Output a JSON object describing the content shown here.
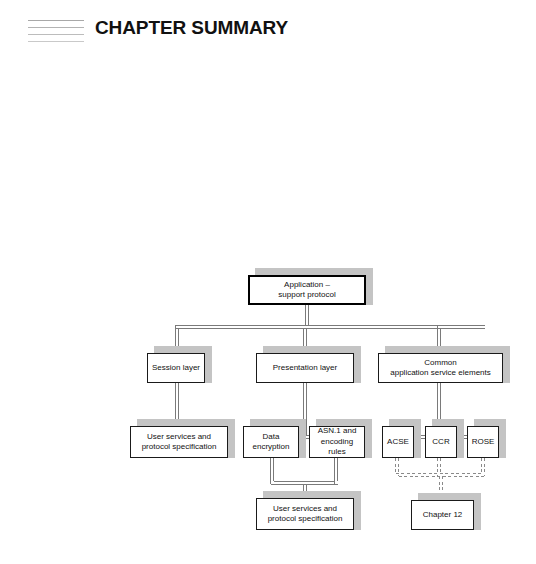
{
  "header": {
    "title": "CHAPTER SUMMARY",
    "menu_icon": "four-horizontal-lines-icon",
    "line_count": 4
  },
  "diagram": {
    "type": "hierarchy-tree",
    "nodes": [
      {
        "id": "root",
        "label": "Application –\nsupport protocol",
        "x": 248,
        "y": 275,
        "w": 118,
        "h": 30,
        "emphasis": "thick-border"
      },
      {
        "id": "session",
        "label": "Session layer",
        "x": 147,
        "y": 353,
        "w": 58,
        "h": 30,
        "emphasis": "normal"
      },
      {
        "id": "presentation",
        "label": "Presentation layer",
        "x": 256,
        "y": 353,
        "w": 98,
        "h": 30,
        "emphasis": "normal"
      },
      {
        "id": "common",
        "label": "Common\napplication service elements",
        "x": 378,
        "y": 353,
        "w": 125,
        "h": 30,
        "emphasis": "normal"
      },
      {
        "id": "user1",
        "label": "User services and\nprotocol specification",
        "x": 130,
        "y": 426,
        "w": 98,
        "h": 32,
        "emphasis": "normal"
      },
      {
        "id": "dataenc",
        "label": "Data\nencryption",
        "x": 243,
        "y": 426,
        "w": 56,
        "h": 32,
        "emphasis": "normal"
      },
      {
        "id": "asn1",
        "label": "ASN.1 and\nencoding rules",
        "x": 309,
        "y": 426,
        "w": 56,
        "h": 32,
        "emphasis": "normal"
      },
      {
        "id": "acse",
        "label": "ACSE",
        "x": 382,
        "y": 426,
        "w": 32,
        "h": 32,
        "emphasis": "normal"
      },
      {
        "id": "ccr",
        "label": "CCR",
        "x": 425,
        "y": 426,
        "w": 32,
        "h": 32,
        "emphasis": "normal"
      },
      {
        "id": "rose",
        "label": "ROSE",
        "x": 467,
        "y": 426,
        "w": 32,
        "h": 32,
        "emphasis": "normal"
      },
      {
        "id": "user2",
        "label": "User services and\nprotocol specification",
        "x": 256,
        "y": 498,
        "w": 98,
        "h": 32,
        "emphasis": "normal"
      },
      {
        "id": "chapter12",
        "label": "Chapter 12",
        "x": 411,
        "y": 500,
        "w": 63,
        "h": 30,
        "emphasis": "normal"
      }
    ],
    "edges": [
      {
        "from": "root",
        "to": "session",
        "style": "double-solid"
      },
      {
        "from": "root",
        "to": "presentation",
        "style": "double-solid"
      },
      {
        "from": "root",
        "to": "common",
        "style": "double-solid"
      },
      {
        "from": "session",
        "to": "user1",
        "style": "double-solid"
      },
      {
        "from": "presentation",
        "to": "dataenc",
        "style": "double-solid"
      },
      {
        "from": "presentation",
        "to": "asn1",
        "style": "double-solid"
      },
      {
        "from": "common",
        "to": "acse",
        "style": "double-solid"
      },
      {
        "from": "common",
        "to": "ccr",
        "style": "double-solid"
      },
      {
        "from": "common",
        "to": "rose",
        "style": "double-solid"
      },
      {
        "from": "dataenc",
        "to": "user2",
        "style": "double-solid"
      },
      {
        "from": "asn1",
        "to": "user2",
        "style": "double-solid"
      },
      {
        "from": "acse",
        "to": "chapter12",
        "style": "dashed"
      },
      {
        "from": "ccr",
        "to": "chapter12",
        "style": "dashed"
      },
      {
        "from": "rose",
        "to": "chapter12",
        "style": "dashed"
      }
    ],
    "colors": {
      "box_border": "#1a1a1a",
      "box_fill": "#ffffff",
      "shadow": "#c4c4c4",
      "connector": "#6e6e6e",
      "text": "#111111"
    }
  }
}
